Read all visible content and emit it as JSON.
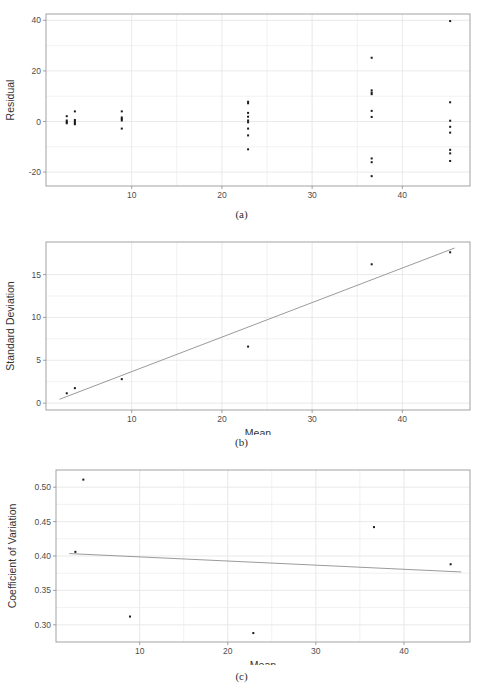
{
  "figure": {
    "background": "#ffffff",
    "point_color": "#1a1a1a",
    "line_color": "#8f8f8f",
    "grid_color": "#ebebeb",
    "frame_color": "#8c8c8c"
  },
  "captions": {
    "a": "(a)",
    "b": "(b)",
    "c": "(c)"
  },
  "chart_data": [
    {
      "id": "a",
      "type": "scatter",
      "title": "",
      "xlabel": "Mean",
      "ylabel": "Residual",
      "xlim": [
        0.5,
        47.5
      ],
      "ylim": [
        -25.5,
        42.5
      ],
      "xticks": [
        10,
        20,
        30,
        40
      ],
      "xticklabels": [
        "10",
        "20",
        "30",
        "40"
      ],
      "yticks": [
        -20,
        0,
        20,
        40
      ],
      "yticklabels": [
        "-20",
        "0",
        "20",
        "40"
      ],
      "grid": true,
      "legend": "none",
      "points": [
        {
          "x": 2.8,
          "y": 2.1
        },
        {
          "x": 2.8,
          "y": 0.4
        },
        {
          "x": 2.8,
          "y": -0.2
        },
        {
          "x": 2.8,
          "y": -0.7
        },
        {
          "x": 3.7,
          "y": 4.0
        },
        {
          "x": 3.7,
          "y": 0.6
        },
        {
          "x": 3.7,
          "y": 0.0
        },
        {
          "x": 3.7,
          "y": -0.6
        },
        {
          "x": 3.7,
          "y": -1.1
        },
        {
          "x": 8.9,
          "y": 4.0
        },
        {
          "x": 8.9,
          "y": 1.6
        },
        {
          "x": 8.9,
          "y": 1.0
        },
        {
          "x": 8.9,
          "y": 0.4
        },
        {
          "x": 8.9,
          "y": -2.8
        },
        {
          "x": 22.9,
          "y": 7.8
        },
        {
          "x": 22.9,
          "y": 7.2
        },
        {
          "x": 22.9,
          "y": 3.4
        },
        {
          "x": 22.9,
          "y": 1.9
        },
        {
          "x": 22.9,
          "y": 0.4
        },
        {
          "x": 22.9,
          "y": -0.3
        },
        {
          "x": 22.9,
          "y": -2.8
        },
        {
          "x": 22.9,
          "y": -5.5
        },
        {
          "x": 22.9,
          "y": -11.0
        },
        {
          "x": 36.6,
          "y": 25.2
        },
        {
          "x": 36.6,
          "y": 12.3
        },
        {
          "x": 36.6,
          "y": 11.4
        },
        {
          "x": 36.6,
          "y": 10.8
        },
        {
          "x": 36.6,
          "y": 4.2
        },
        {
          "x": 36.6,
          "y": 1.8
        },
        {
          "x": 36.6,
          "y": -14.6
        },
        {
          "x": 36.6,
          "y": -16.1
        },
        {
          "x": 36.6,
          "y": -21.6
        },
        {
          "x": 45.3,
          "y": 39.7
        },
        {
          "x": 45.3,
          "y": 7.6
        },
        {
          "x": 45.3,
          "y": 0.3
        },
        {
          "x": 45.3,
          "y": -2.1
        },
        {
          "x": 45.3,
          "y": -4.4
        },
        {
          "x": 45.3,
          "y": -11.2
        },
        {
          "x": 45.3,
          "y": -12.6
        },
        {
          "x": 45.3,
          "y": -15.6
        }
      ]
    },
    {
      "id": "b",
      "type": "scatter",
      "title": "",
      "xlabel": "Mean",
      "ylabel": "Standard Deviation",
      "xlim": [
        0.5,
        47.5
      ],
      "ylim": [
        -0.8,
        18.8
      ],
      "xticks": [
        10,
        20,
        30,
        40
      ],
      "xticklabels": [
        "10",
        "20",
        "30",
        "40"
      ],
      "yticks": [
        0,
        5,
        10,
        15
      ],
      "yticklabels": [
        "0",
        "5",
        "10",
        "15"
      ],
      "grid": true,
      "legend": "none",
      "points": [
        {
          "x": 2.8,
          "y": 1.15
        },
        {
          "x": 3.7,
          "y": 1.75
        },
        {
          "x": 8.9,
          "y": 2.8
        },
        {
          "x": 22.9,
          "y": 6.6
        },
        {
          "x": 36.6,
          "y": 16.2
        },
        {
          "x": 45.3,
          "y": 17.6
        }
      ],
      "fit_line": {
        "x": [
          2.0,
          45.8
        ],
        "y": [
          0.45,
          18.1
        ],
        "type": "linear-fit"
      }
    },
    {
      "id": "c",
      "type": "scatter",
      "title": "",
      "xlabel": "Mean",
      "ylabel": "Coefficient of Variation",
      "xlim": [
        0.5,
        47.5
      ],
      "ylim": [
        0.275,
        0.525
      ],
      "xticks": [
        10,
        20,
        30,
        40
      ],
      "xticklabels": [
        "10",
        "20",
        "30",
        "40"
      ],
      "yticks": [
        0.3,
        0.35,
        0.4,
        0.45,
        0.5
      ],
      "yticklabels": [
        "0.30",
        "0.35",
        "0.40",
        "0.45",
        "0.50"
      ],
      "grid": true,
      "legend": "none",
      "points": [
        {
          "x": 3.6,
          "y": 0.511
        },
        {
          "x": 2.7,
          "y": 0.406
        },
        {
          "x": 8.9,
          "y": 0.312
        },
        {
          "x": 22.9,
          "y": 0.288
        },
        {
          "x": 36.6,
          "y": 0.442
        },
        {
          "x": 45.3,
          "y": 0.388
        }
      ],
      "fit_line": {
        "x": [
          2.0,
          46.5
        ],
        "y": [
          0.4035,
          0.3768
        ],
        "type": "linear-fit"
      }
    }
  ]
}
